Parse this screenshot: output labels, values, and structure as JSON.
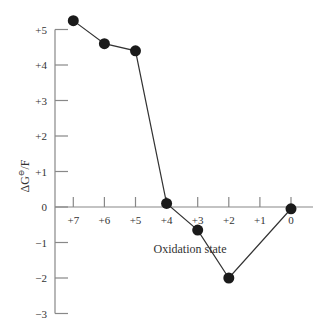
{
  "chart_data": {
    "type": "line",
    "title": "",
    "xlabel": "Oxidation state",
    "ylabel": "ΔG°/F",
    "x_tick_labels": [
      "+7",
      "+6",
      "+5",
      "+4",
      "+3",
      "+2",
      "+1",
      "0"
    ],
    "x_tick_values": [
      7,
      6,
      5,
      4,
      3,
      2,
      1,
      0
    ],
    "y_tick_labels": [
      "+5",
      "+4",
      "+3",
      "+2",
      "+1",
      "0",
      "−1",
      "−2",
      "−3"
    ],
    "y_tick_values": [
      5,
      4,
      3,
      2,
      1,
      0,
      -1,
      -2,
      -3
    ],
    "xlim": [
      7.5,
      -0.5
    ],
    "ylim": [
      -3,
      5.3
    ],
    "grid": false,
    "legend": null,
    "series": [
      {
        "name": "Frost diagram",
        "x": [
          7,
          6,
          5,
          4,
          3,
          2,
          0
        ],
        "y": [
          5.25,
          4.6,
          4.4,
          0.1,
          -0.65,
          -2.0,
          -0.05
        ],
        "marker": "filled-circle",
        "color": "#1a1a1a"
      }
    ],
    "axis_color": "#888888"
  }
}
